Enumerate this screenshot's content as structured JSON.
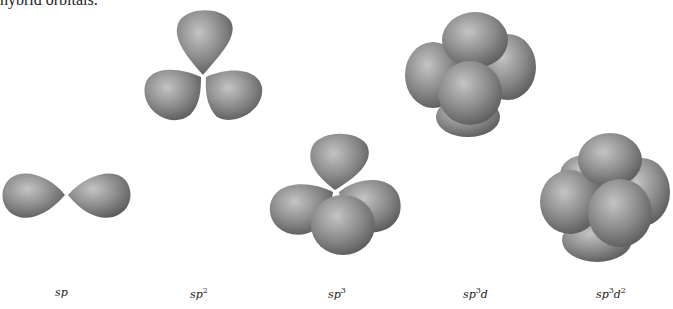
{
  "caption": "hybrid orbitals.",
  "figures": [
    {
      "name": "sp",
      "label_base": "sp",
      "sup1": "",
      "mid": "",
      "sup2": "",
      "lobes": 2
    },
    {
      "name": "sp2",
      "label_base": "sp",
      "sup1": "2",
      "mid": "",
      "sup2": "",
      "lobes": 3
    },
    {
      "name": "sp3",
      "label_base": "sp",
      "sup1": "3",
      "mid": "",
      "sup2": "",
      "lobes": 4
    },
    {
      "name": "sp3d",
      "label_base": "sp",
      "sup1": "3",
      "mid": "d",
      "sup2": "",
      "lobes": 5
    },
    {
      "name": "sp3d2",
      "label_base": "sp",
      "sup1": "3",
      "mid": "d",
      "sup2": "2",
      "lobes": 6
    }
  ],
  "colors": {
    "lobe_light": "#bdbdbd",
    "lobe_mid": "#8f8f8f",
    "lobe_dark": "#5e5e5e"
  }
}
